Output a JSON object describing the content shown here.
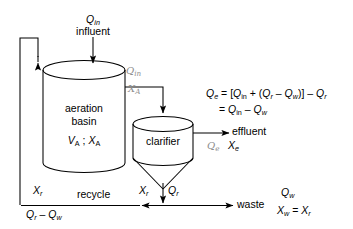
{
  "diagram": {
    "units": {
      "aeration_basin": {
        "name_line1": "aeration",
        "name_line2": "basin",
        "params": "V",
        "params_sub1": "A",
        "params_sep": " ; ",
        "params_x": "X",
        "params_sub2": "A"
      },
      "clarifier": {
        "name": "clarifier"
      }
    },
    "streams": {
      "influent": {
        "symbol": "Q",
        "sub": "in",
        "label": "influent"
      },
      "effluent": {
        "label": "effluent",
        "hand_symbol": "Q",
        "hand_sub": "e",
        "conc": "X",
        "conc_sub": "e"
      },
      "recycle": {
        "label": "recycle",
        "conc": "X",
        "conc_sub": "r",
        "flow": "Q",
        "flow_sub1": "r",
        "minus": " – ",
        "flow2": "Q",
        "flow_sub2": "w"
      },
      "waste": {
        "label": "waste",
        "flow": "Q",
        "flow_sub": "w",
        "conc_lhs": "X",
        "conc_lhs_sub": "w",
        "eq": " = ",
        "conc_rhs": "X",
        "conc_rhs_sub": "r"
      },
      "underflow": {
        "conc": "X",
        "conc_sub": "r",
        "flow": "Q",
        "flow_sub": "r"
      },
      "basin_outlet_hand": {
        "symbol": "Q",
        "sub": "in",
        "conc": "X",
        "conc_sub": "A"
      }
    },
    "equation": {
      "line1": "Qₑ = [Qᵢₙ + (Qᵣ – Qᵥᵥ)] – Qᵣ",
      "line1_parts": {
        "lhs": "Q",
        "lhs_sub": "e",
        "eq": " = [",
        "a": "Q",
        "a_sub": "in",
        "plus": " + (",
        "b": "Q",
        "b_sub": "r",
        "minus": " – ",
        "c": "Q",
        "c_sub": "w",
        "close": ")] – ",
        "d": "Q",
        "d_sub": "r"
      },
      "line2_parts": {
        "eq": "= ",
        "a": "Q",
        "a_sub": "in",
        "minus": " – ",
        "b": "Q",
        "b_sub": "w"
      }
    },
    "colors": {
      "ink": "#000000",
      "handwriting": "#8d8d8d",
      "background": "#ffffff"
    }
  }
}
